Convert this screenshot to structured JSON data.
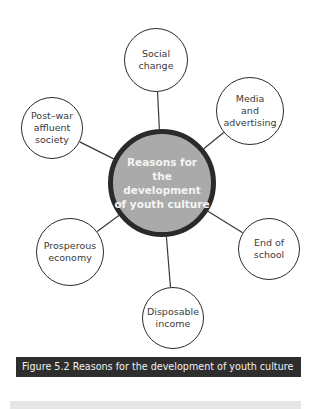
{
  "diagram": {
    "type": "mind-map",
    "hub": {
      "label": "Reasons for\nthe development\nof youth culture",
      "x": 162,
      "y": 183,
      "r": 54
    },
    "nodes": [
      {
        "id": "social-change",
        "label": "Social\nchange",
        "x": 156,
        "y": 60,
        "r": 32
      },
      {
        "id": "media-advertising",
        "label": "Media\nand\nadvertising",
        "x": 250,
        "y": 111,
        "r": 34
      },
      {
        "id": "post-war-affluent-society",
        "label": "Post–war\naffluent\nsociety",
        "x": 52,
        "y": 128,
        "r": 31
      },
      {
        "id": "prosperous-economy",
        "label": "Prosperous\neconomy",
        "x": 70,
        "y": 252,
        "r": 34
      },
      {
        "id": "end-of-school",
        "label": "End of\nschool",
        "x": 269,
        "y": 249,
        "r": 31
      },
      {
        "id": "disposable-income",
        "label": "Disposable\nincome",
        "x": 173,
        "y": 318,
        "r": 31
      }
    ],
    "colors": {
      "hub_fill": "#aaaaaa",
      "hub_border": "#2a2a2a",
      "line": "#3a3a3a",
      "caption_bg": "#2e2e2e"
    }
  },
  "caption": "Figure 5.2 Reasons for the development of youth culture"
}
